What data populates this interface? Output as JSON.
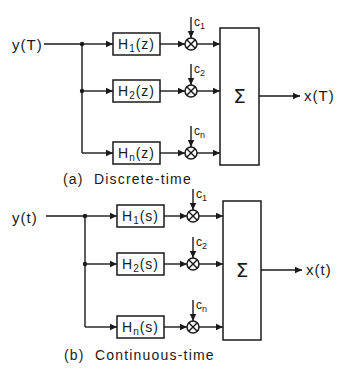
{
  "figure": {
    "colors": {
      "ink": "#1a1a1a",
      "background": "#ffffff"
    },
    "diagrams": [
      {
        "id": "discrete",
        "caption": "(a)  Discrete-time",
        "input_label": "y(T)",
        "output_label": "x(T)",
        "sum_symbol": "Σ",
        "branches": [
          {
            "filter": "H",
            "sub": "1",
            "arg": "(z)",
            "coef": "c",
            "coef_sub": "1"
          },
          {
            "filter": "H",
            "sub": "2",
            "arg": "(z)",
            "coef": "c",
            "coef_sub": "2"
          },
          {
            "filter": "H",
            "sub": "n",
            "arg": "(z)",
            "coef": "c",
            "coef_sub": "n"
          }
        ],
        "layout": {
          "input_text_x": 12,
          "input_y": 45,
          "line_start_x": 44,
          "junction_x": 82,
          "box_x": 113,
          "box_w": 47,
          "box_h": 22,
          "branch_y": [
            44,
            91,
            153
          ],
          "mult_x": 191,
          "mult_r": 6,
          "coef_top_offset": 27,
          "sum_x": 220,
          "sum_y": 28,
          "sum_w": 39,
          "sum_h": 137,
          "out_end_x": 300,
          "out_text_x": 304,
          "out_y": 96,
          "caption_x": 63,
          "caption_y": 184
        }
      },
      {
        "id": "continuous",
        "caption": "(b)  Continuous-time",
        "input_label": "y(t)",
        "output_label": "x(t)",
        "sum_symbol": "Σ",
        "branches": [
          {
            "filter": "H",
            "sub": "1",
            "arg": "(s)",
            "coef": "c",
            "coef_sub": "1"
          },
          {
            "filter": "H",
            "sub": "2",
            "arg": "(s)",
            "coef": "c",
            "coef_sub": "2"
          },
          {
            "filter": "H",
            "sub": "n",
            "arg": "(s)",
            "coef": "c",
            "coef_sub": "n"
          }
        ],
        "layout": {
          "input_text_x": 12,
          "input_y": 218,
          "line_start_x": 46,
          "junction_x": 85,
          "box_x": 117,
          "box_w": 47,
          "box_h": 22,
          "branch_y": [
            216,
            264,
            327
          ],
          "mult_x": 193,
          "mult_r": 6,
          "coef_top_offset": 27,
          "sum_x": 223,
          "sum_y": 201,
          "sum_w": 38,
          "sum_h": 139,
          "out_end_x": 302,
          "out_text_x": 306,
          "out_y": 270,
          "caption_x": 64,
          "caption_y": 360
        }
      }
    ]
  }
}
